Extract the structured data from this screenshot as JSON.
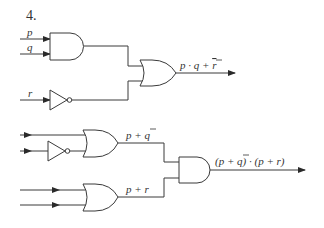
{
  "problem_number": "4.",
  "circuit_1": {
    "inputs": {
      "p": "p",
      "q": "q",
      "r": "r"
    },
    "gates": [
      "AND",
      "NOT",
      "OR"
    ],
    "output_label_main": "p · q + ",
    "output_label_negated": "r"
  },
  "circuit_2": {
    "inputs": [
      "p",
      "q",
      "p",
      "r"
    ],
    "gates": [
      "OR",
      "NOT",
      "OR",
      "AND"
    ],
    "intermediate_1_label_main": "p + ",
    "intermediate_1_label_negated": "q",
    "intermediate_2_label": "p + r",
    "output_label_prefix": "(p + ",
    "output_label_negated": "q",
    "output_label_suffix": ") · (p + r)"
  },
  "colors": {
    "line": "#3a3a3a",
    "text": "#333333",
    "background": "#ffffff"
  }
}
